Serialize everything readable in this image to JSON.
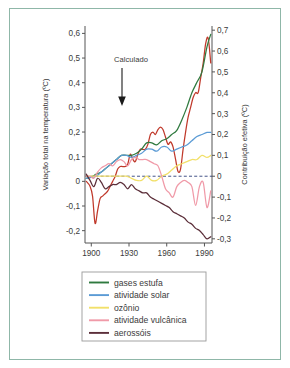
{
  "figure": {
    "border_color": "#8fb7a8",
    "background": "#ffffff"
  },
  "annotation": {
    "label": "Calculado"
  },
  "legend": {
    "items": [
      {
        "label": "gases estufa",
        "color": "#2f7a3f"
      },
      {
        "label": "atividade solar",
        "color": "#5b9bd5"
      },
      {
        "label": "ozônio",
        "color": "#f2e06a"
      },
      {
        "label": "atividade vulcânica",
        "color": "#f09aa8"
      },
      {
        "label": "aerossóis",
        "color": "#5c2f3a"
      }
    ]
  },
  "chart_data": {
    "type": "line",
    "title": "",
    "xlabel": "",
    "ylabel": "Variação total na temperatura (ºC)",
    "y2label": "Contribuição efetiva (ºC)",
    "xlim": [
      1895,
      1996
    ],
    "ylim": [
      -0.25,
      0.63
    ],
    "y2lim": [
      -0.32,
      0.72
    ],
    "grid": false,
    "legend_position": "bottom",
    "xticks": [
      1900,
      1930,
      1960,
      1990
    ],
    "yticks": [
      0.6,
      0.5,
      0.4,
      0.3,
      0.2,
      0.1,
      0,
      -0.1,
      -0.2
    ],
    "ytick_labels": [
      "0,6",
      "0,5",
      "0,4",
      "0,3",
      "0,2",
      "0,1",
      "0",
      "-0,1",
      "-0,2"
    ],
    "y2ticks": [
      0.7,
      0.6,
      0.5,
      0.4,
      0.3,
      0.2,
      0.1,
      0,
      -0.1,
      -0.2,
      -0.3
    ],
    "y2tick_labels": [
      "0,7",
      "0,6",
      "0,5",
      "0,4",
      "0,3",
      "0,2",
      "0,1",
      "0",
      "-0,1",
      "-0,2",
      "-0,3"
    ],
    "zero_reference_line": true,
    "series": [
      {
        "name": "Calculado",
        "color": "#c0392b",
        "axis": "left",
        "annotated": true,
        "x": [
          1896,
          1899,
          1901,
          1903,
          1905,
          1907,
          1909,
          1911,
          1913,
          1915,
          1917,
          1919,
          1921,
          1923,
          1925,
          1927,
          1929,
          1931,
          1933,
          1935,
          1937,
          1939,
          1941,
          1943,
          1945,
          1947,
          1949,
          1951,
          1953,
          1955,
          1957,
          1959,
          1961,
          1963,
          1965,
          1967,
          1969,
          1971,
          1973,
          1975,
          1977,
          1979,
          1981,
          1983,
          1985,
          1987,
          1989,
          1991,
          1993,
          1995
        ],
        "y": [
          0.0,
          -0.02,
          -0.06,
          -0.17,
          -0.12,
          -0.07,
          -0.06,
          -0.05,
          -0.04,
          -0.02,
          0.0,
          0.02,
          0.05,
          0.06,
          0.06,
          0.06,
          0.07,
          0.11,
          0.09,
          0.08,
          0.11,
          0.13,
          0.13,
          0.13,
          0.15,
          0.19,
          0.2,
          0.19,
          0.21,
          0.22,
          0.21,
          0.18,
          0.15,
          0.16,
          0.14,
          0.09,
          0.04,
          0.05,
          0.13,
          0.2,
          0.26,
          0.3,
          0.34,
          0.36,
          0.36,
          0.42,
          0.48,
          0.56,
          0.58,
          0.48
        ]
      },
      {
        "name": "gases estufa",
        "color": "#2f7a3f",
        "axis": "right",
        "x": [
          1896,
          1900,
          1904,
          1908,
          1912,
          1916,
          1920,
          1924,
          1928,
          1932,
          1936,
          1940,
          1944,
          1948,
          1952,
          1956,
          1960,
          1964,
          1968,
          1972,
          1976,
          1980,
          1984,
          1988,
          1992,
          1995
        ],
        "y": [
          -0.01,
          -0.005,
          0.01,
          0.02,
          0.04,
          0.06,
          0.08,
          0.1,
          0.1,
          0.1,
          0.11,
          0.13,
          0.16,
          0.16,
          0.15,
          0.17,
          0.18,
          0.2,
          0.22,
          0.27,
          0.33,
          0.4,
          0.45,
          0.5,
          0.62,
          0.68
        ]
      },
      {
        "name": "atividade solar",
        "color": "#5b9bd5",
        "axis": "right",
        "x": [
          1896,
          1900,
          1904,
          1908,
          1912,
          1916,
          1920,
          1924,
          1928,
          1932,
          1936,
          1940,
          1944,
          1948,
          1952,
          1956,
          1960,
          1964,
          1968,
          1972,
          1976,
          1980,
          1984,
          1988,
          1992,
          1995
        ],
        "y": [
          -0.01,
          -0.005,
          0.0,
          0.02,
          0.04,
          0.06,
          0.08,
          0.1,
          0.1,
          0.09,
          0.1,
          0.11,
          0.13,
          0.13,
          0.12,
          0.14,
          0.14,
          0.12,
          0.13,
          0.14,
          0.15,
          0.17,
          0.19,
          0.2,
          0.21,
          0.21
        ]
      },
      {
        "name": "ozônio",
        "color": "#f2e06a",
        "axis": "right",
        "x": [
          1896,
          1900,
          1904,
          1908,
          1912,
          1916,
          1920,
          1924,
          1928,
          1932,
          1936,
          1940,
          1944,
          1948,
          1952,
          1956,
          1960,
          1964,
          1968,
          1972,
          1976,
          1980,
          1984,
          1988,
          1992,
          1995
        ],
        "y": [
          0.0,
          0.0,
          0.0,
          0.0,
          0.0,
          0.0,
          0.0,
          0.0,
          0.0,
          -0.01,
          -0.02,
          -0.02,
          0.0,
          -0.02,
          -0.02,
          0.0,
          0.01,
          0.03,
          0.05,
          0.06,
          0.07,
          0.08,
          0.08,
          0.1,
          0.09,
          0.1
        ]
      },
      {
        "name": "atividade vulcânica",
        "color": "#f09aa8",
        "axis": "right",
        "x": [
          1896,
          1899,
          1902,
          1905,
          1908,
          1911,
          1914,
          1917,
          1920,
          1923,
          1926,
          1929,
          1932,
          1935,
          1938,
          1941,
          1944,
          1947,
          1950,
          1953,
          1956,
          1959,
          1962,
          1965,
          1968,
          1971,
          1974,
          1977,
          1980,
          1983,
          1986,
          1989,
          1992,
          1995
        ],
        "y": [
          0.0,
          0.0,
          -0.01,
          0.02,
          0.04,
          0.05,
          0.06,
          0.05,
          0.07,
          0.08,
          0.07,
          0.05,
          0.08,
          0.09,
          0.08,
          0.08,
          0.08,
          0.07,
          0.06,
          0.05,
          0.0,
          -0.06,
          -0.08,
          -0.1,
          -0.05,
          -0.03,
          -0.02,
          -0.03,
          -0.05,
          -0.14,
          -0.05,
          -0.03,
          -0.15,
          -0.07
        ]
      },
      {
        "name": "aerossóis",
        "color": "#5c2f3a",
        "axis": "right",
        "x": [
          1896,
          1899,
          1902,
          1905,
          1908,
          1911,
          1914,
          1917,
          1920,
          1923,
          1926,
          1929,
          1932,
          1935,
          1938,
          1941,
          1944,
          1947,
          1950,
          1953,
          1956,
          1959,
          1962,
          1965,
          1968,
          1971,
          1974,
          1977,
          1980,
          1983,
          1986,
          1989,
          1992,
          1995
        ],
        "y": [
          0.01,
          -0.02,
          -0.05,
          -0.01,
          -0.03,
          -0.06,
          -0.05,
          -0.04,
          -0.04,
          -0.03,
          -0.04,
          -0.06,
          -0.04,
          -0.06,
          -0.07,
          -0.08,
          -0.08,
          -0.1,
          -0.11,
          -0.12,
          -0.13,
          -0.14,
          -0.15,
          -0.17,
          -0.18,
          -0.19,
          -0.2,
          -0.22,
          -0.23,
          -0.25,
          -0.26,
          -0.28,
          -0.3,
          -0.29
        ]
      }
    ]
  }
}
